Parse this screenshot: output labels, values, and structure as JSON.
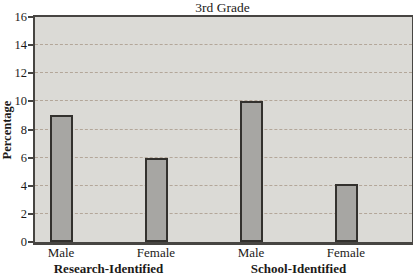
{
  "chart_data": {
    "type": "bar",
    "title": "3rd Grade",
    "ylabel": "Percentage",
    "xlabel": "",
    "ylim": [
      0,
      16
    ],
    "yticks": [
      0,
      2,
      4,
      6,
      8,
      10,
      12,
      14,
      16
    ],
    "gridlines": [
      2,
      4,
      6,
      8,
      10,
      12,
      14
    ],
    "grid": "horizontal-dashed",
    "legend": "none",
    "groups": [
      {
        "label": "Research-Identified",
        "bars": [
          {
            "category": "Male",
            "value": 9
          },
          {
            "category": "Female",
            "value": 6
          }
        ]
      },
      {
        "label": "School-Identified",
        "bars": [
          {
            "category": "Male",
            "value": 10
          },
          {
            "category": "Female",
            "value": 4.1
          }
        ]
      }
    ],
    "colors": {
      "bar_fill": "#a7a6a3",
      "bar_border": "#33312e",
      "plot_background": "#dbdad6",
      "gridline": "#b3a699",
      "frame": "#474542",
      "text": "#1c1a18"
    }
  }
}
